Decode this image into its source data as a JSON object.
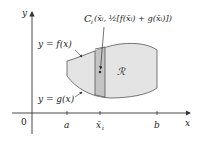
{
  "figure": {
    "axes": {
      "x_label": "x",
      "y_label": "y",
      "origin_label": "0",
      "ticks": [
        {
          "label": "a",
          "x": 67
        },
        {
          "label": "x̄",
          "sub": "i",
          "x": 100
        },
        {
          "label": "b",
          "x": 157
        }
      ]
    },
    "curves": {
      "upper_label": "y = f(x)",
      "lower_label": "y = g(x)"
    },
    "region_label": "ℛ",
    "centroid_label": {
      "C": "C",
      "sub": "i",
      "text": "(x̄ᵢ, ½[f(x̄ᵢ) + g(x̄ᵢ)])"
    },
    "colors": {
      "region_fill": "#e4e4e4",
      "strip_fill": "#c4c4c4",
      "outline": "#555555",
      "axis": "#333333"
    }
  }
}
